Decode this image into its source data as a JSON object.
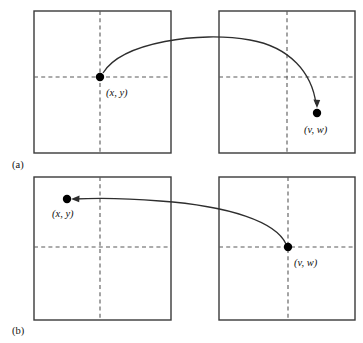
{
  "figure": {
    "background_color": "#ffffff",
    "line_color": "#3a3a3a",
    "dash_color": "#5a5a5a",
    "curve_color": "#2e2e2e",
    "dot_color": "#000000",
    "panels": [
      {
        "caption": "(a)",
        "caption_x": 12,
        "caption_y": 168,
        "squares": [
          {
            "x": 34,
            "y": 11,
            "w": 137,
            "h": 142,
            "vdash_x": 100,
            "hdash_y": 77
          },
          {
            "x": 219,
            "y": 11,
            "w": 136,
            "h": 142,
            "vdash_x": 287,
            "hdash_y": 77
          }
        ],
        "points": [
          {
            "label": "(x, y)",
            "cx": 100,
            "cy": 77,
            "r": 4.2,
            "label_x": 106,
            "label_y": 96
          },
          {
            "label": "(v, w)",
            "cx": 317,
            "cy": 113,
            "r": 4.2,
            "label_x": 304,
            "label_y": 133
          }
        ],
        "curve": {
          "path": "M 103 73 C 122 42 200 31 250 40 C 290 47 312 73 316 104",
          "arrow_tip_x": 317,
          "arrow_tip_y": 108,
          "arrow_dir": "down",
          "direction_note": "arrow from (x, y) to (v, w)"
        }
      },
      {
        "caption": "(b)",
        "caption_x": 12,
        "caption_y": 334,
        "squares": [
          {
            "x": 34,
            "y": 177,
            "w": 137,
            "h": 143,
            "vdash_x": 100,
            "hdash_y": 247
          },
          {
            "x": 219,
            "y": 177,
            "w": 136,
            "h": 143,
            "vdash_x": 288,
            "hdash_y": 247
          }
        ],
        "points": [
          {
            "label": "(x, y)",
            "cx": 67,
            "cy": 199,
            "r": 4.2,
            "label_x": 52,
            "label_y": 217
          },
          {
            "label": "(v, w)",
            "cx": 288,
            "cy": 247,
            "r": 4.2,
            "label_x": 294,
            "label_y": 266
          }
        ],
        "curve": {
          "path": "M 286 244 C 276 222 230 206 160 201 C 125 198 92 198 74 199",
          "arrow_tip_x": 71,
          "arrow_tip_y": 199,
          "arrow_dir": "left",
          "direction_note": "arrow from (v, w) to (x, y)"
        }
      }
    ]
  }
}
